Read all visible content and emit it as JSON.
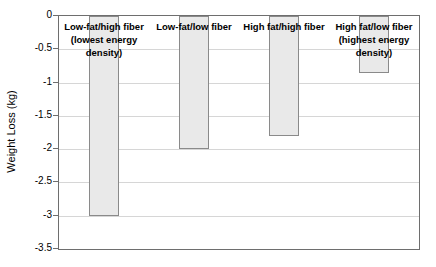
{
  "chart_data": {
    "type": "bar",
    "title": "",
    "categories": [
      "Low-fat/high fiber\n(lowest energy\ndensity)",
      "Low-fat/low fiber",
      "High fat/high fiber",
      "High fat/low fiber\n(highest energy\ndensity)"
    ],
    "values": [
      -3.0,
      -2.0,
      -1.8,
      -0.85
    ],
    "xlabel": "",
    "ylabel": "Weight Loss (kg)",
    "ylim": [
      0,
      -3.5
    ],
    "ytick_step": 0.5,
    "ytick_labels": [
      "0",
      "-0.5",
      "-1",
      "-1.5",
      "-2",
      "-2.5",
      "-3",
      "-3.5"
    ],
    "grid": true,
    "legend": false,
    "colors": {
      "bar_fill": "#e9e9e9",
      "bar_border": "#8a8a8a",
      "gridline": "#d6d6d6",
      "axis_border": "#6e6e6e",
      "background": "#ffffff",
      "text": "#000000"
    }
  }
}
